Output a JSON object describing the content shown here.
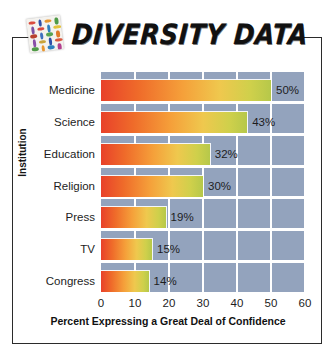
{
  "header": {
    "title": "DIVERSITY DATA",
    "logo_icon": "diversity-tiles-icon",
    "logo_pill_colors": [
      "#d94a3e",
      "#2f4fa8",
      "#e8962f",
      "#4f9a47",
      "#7b4fa3",
      "#d94a3e",
      "#2f7fbf",
      "#e3c23a",
      "#b8402f",
      "#3f6fbf",
      "#57a352",
      "#e07a2a",
      "#8a4fa8",
      "#c9a33a",
      "#2f4fa8",
      "#d9573e",
      "#4f9a47",
      "#e8962f",
      "#2f7fbf",
      "#b33f8f"
    ]
  },
  "chart_data": {
    "type": "bar",
    "orientation": "horizontal",
    "title": "DIVERSITY DATA",
    "xlabel": "Percent Expressing a Great Deal of Confidence",
    "ylabel": "Institution",
    "categories": [
      "Medicine",
      "Science",
      "Education",
      "Religion",
      "Press",
      "TV",
      "Congress"
    ],
    "values": [
      50,
      43,
      32,
      30,
      19,
      15,
      14
    ],
    "value_labels": [
      "50%",
      "43%",
      "32%",
      "30%",
      "19%",
      "15%",
      "14%"
    ],
    "xlim": [
      0,
      60
    ],
    "xticks": [
      0,
      10,
      20,
      30,
      40,
      50,
      60
    ],
    "xtick_labels": [
      "0",
      "10",
      "20",
      "30",
      "40",
      "50",
      "60"
    ],
    "grid": "vertical",
    "legend": "none",
    "plot_background_color": "#93a3bd",
    "gridline_color": "#ffffff",
    "bar_gradient_start": "#e8412a",
    "bar_gradient_end": "#b6c84a"
  }
}
